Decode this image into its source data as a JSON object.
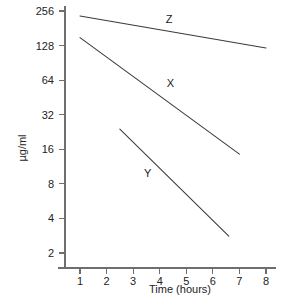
{
  "chart_data": {
    "type": "line",
    "title": "",
    "xlabel": "Time (hours)",
    "ylabel": "µg/ml",
    "xlim": [
      0.55,
      8.45
    ],
    "ylim": [
      1.74,
      300
    ],
    "yscale": "log2",
    "xscale": "linear",
    "grid": false,
    "legend": "inline-labels",
    "xticks": [
      1,
      2,
      3,
      4,
      5,
      6,
      7,
      8
    ],
    "xtick_labels": [
      "1",
      "2",
      "3",
      "4",
      "5",
      "6",
      "7",
      "8"
    ],
    "yticks": [
      2,
      4,
      8,
      16,
      32,
      64,
      128,
      256
    ],
    "ytick_labels": [
      "2",
      "4",
      "8",
      "16",
      "32",
      "64",
      "128",
      "256"
    ],
    "series": [
      {
        "name": "Z",
        "label": "Z",
        "label_x": 4.35,
        "label_y": 200,
        "x": [
          1,
          8
        ],
        "values": [
          232,
          122
        ]
      },
      {
        "name": "X",
        "label": "X",
        "label_x": 4.4,
        "label_y": 56,
        "x": [
          1,
          7
        ],
        "values": [
          150,
          14.5
        ]
      },
      {
        "name": "Y",
        "label": "Y",
        "label_x": 3.55,
        "label_y": 9.1,
        "x": [
          2.5,
          6.6
        ],
        "values": [
          24,
          2.8
        ]
      }
    ]
  },
  "axes": {
    "x_axis_name": "time-axis",
    "y_axis_name": "concentration-axis"
  },
  "colors": {
    "line": "#3a3a3a",
    "axis": "#6e6e6e",
    "text": "#232323",
    "background": "#ffffff"
  }
}
